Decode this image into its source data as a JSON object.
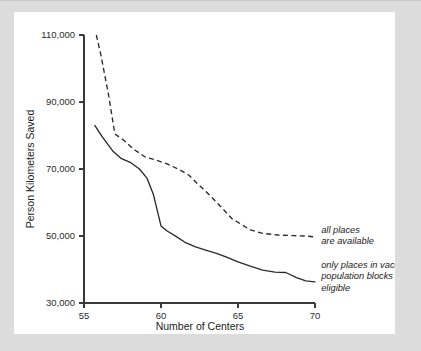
{
  "chart_data": {
    "type": "line",
    "title": "",
    "xlabel": "Number of Centers",
    "ylabel": "Person Kilometers Saved",
    "xlim": [
      55,
      70
    ],
    "ylim": [
      30000,
      110000
    ],
    "xticks": [
      55,
      60,
      65,
      70
    ],
    "xtick_labels": [
      "55",
      "60",
      "65",
      "70"
    ],
    "yticks": [
      30000,
      50000,
      70000,
      90000,
      110000
    ],
    "ytick_labels": [
      "30,000",
      "50,000",
      "70,000",
      "90,000",
      "110,000"
    ],
    "grid": false,
    "legend_position": "inline-annotations-right",
    "series": [
      {
        "name": "all places are available",
        "style": "dashed",
        "annotation_lines": [
          "all places",
          "are available"
        ],
        "x": [
          55.8,
          56.1,
          56.6,
          57.0,
          57.6,
          58.2,
          59.0,
          59.6,
          60.4,
          61.2,
          61.8,
          62.4,
          63.2,
          64.0,
          64.6,
          65.1,
          65.8,
          66.6,
          67.6,
          68.6,
          69.4,
          70.0
        ],
        "y": [
          110000,
          104000,
          92000,
          80500,
          78500,
          76000,
          73500,
          72800,
          71500,
          69800,
          68200,
          65500,
          62000,
          58200,
          55200,
          53800,
          51800,
          50800,
          50300,
          50100,
          50000,
          49700
        ]
      },
      {
        "name": "only places in vacant population blocks are eligible",
        "style": "solid",
        "annotation_lines": [
          "only places in vacant",
          "population blocks are",
          "eligible"
        ],
        "x": [
          55.7,
          56.2,
          56.9,
          57.4,
          58.0,
          58.6,
          59.1,
          59.5,
          60.0,
          60.4,
          61.0,
          61.6,
          62.2,
          62.9,
          63.6,
          64.3,
          65.0,
          65.8,
          66.6,
          67.4,
          68.1,
          68.8,
          69.4,
          70.0
        ],
        "y": [
          83000,
          79500,
          75200,
          73200,
          72000,
          70000,
          67200,
          62500,
          53000,
          51500,
          49800,
          48000,
          46800,
          45800,
          44800,
          43600,
          42300,
          41000,
          39800,
          39200,
          39100,
          37600,
          36600,
          36300
        ]
      }
    ],
    "annotations": [
      {
        "id": "annotation-all-places",
        "lines": [
          "all places",
          "are available"
        ],
        "anchor_x": 70.4,
        "anchor_y": 51000
      },
      {
        "id": "annotation-vacant-blocks",
        "lines": [
          "only places in vacant",
          "population blocks are",
          "eligible"
        ],
        "anchor_x": 70.4,
        "anchor_y": 40500
      }
    ]
  },
  "colors": {
    "page_background": "#dcdcdc",
    "card_background": "#ffffff",
    "axis": "#3a3a3a",
    "series_ink": "#2a2a2a",
    "text": "#1c1c1c"
  }
}
